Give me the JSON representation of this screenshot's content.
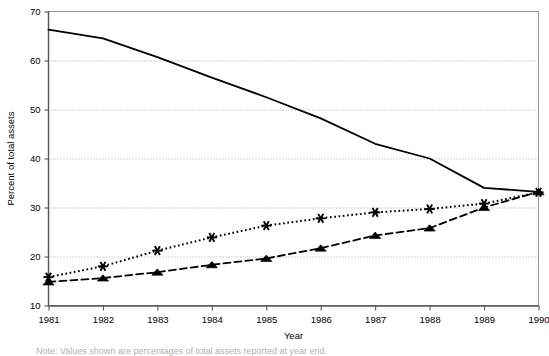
{
  "figure": {
    "width": 549,
    "height": 353,
    "background": "#ffffff",
    "footnote": "Note: Values shown are percentages of total assets reported at year end."
  },
  "axes": {
    "y_title": "Percent of total assets",
    "x_title": "Year",
    "y_ticks": [
      "10",
      "20",
      "30",
      "40",
      "50",
      "60",
      "70"
    ],
    "x_ticks": [
      "1981",
      "1982",
      "1983",
      "1984",
      "1985",
      "1986",
      "1987",
      "1988",
      "1989",
      "1990"
    ],
    "grid_color": "#9a9a9a",
    "frame_color": "#8a8a8a",
    "axis_color": "#555555"
  },
  "chart_data": {
    "type": "line",
    "title": "",
    "subtitle": "",
    "xlabel": "Year",
    "ylabel": "Percent of total assets",
    "x": [
      1981,
      1982,
      1983,
      1984,
      1985,
      1986,
      1987,
      1988,
      1989,
      1990
    ],
    "xlim": [
      1981,
      1990
    ],
    "ylim": [
      10,
      70
    ],
    "ytick_step": 10,
    "grid": "horizontal-dotted",
    "legend": "none",
    "series": [
      {
        "name": "Series 1",
        "style": "solid",
        "marker": "none",
        "color": "#000000",
        "values": [
          66.3,
          64.5,
          60.7,
          56.5,
          52.5,
          48.2,
          43.0,
          40.0,
          34.0,
          33.2
        ]
      },
      {
        "name": "Series 2",
        "style": "dotted",
        "marker": "asterisk",
        "color": "#000000",
        "values": [
          15.8,
          18.0,
          21.2,
          23.9,
          26.3,
          27.8,
          29.0,
          29.7,
          30.8,
          33.1
        ]
      },
      {
        "name": "Series 3",
        "style": "dashed",
        "marker": "triangle",
        "color": "#000000",
        "values": [
          14.8,
          15.6,
          16.8,
          18.3,
          19.6,
          21.7,
          24.3,
          25.8,
          30.0,
          33.2
        ]
      }
    ]
  }
}
